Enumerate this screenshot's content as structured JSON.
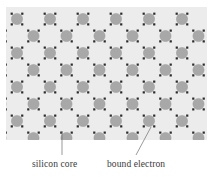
{
  "figure": {
    "type": "silicon-crystal-lattice-diagram",
    "top_caption_fragment": "",
    "panel": {
      "background_color": "#ececec",
      "x": 6,
      "y": 7,
      "width": 201,
      "height": 133
    },
    "atom": {
      "name": "silicon-core",
      "fill_color": "#a8a8a8",
      "stroke_color": "#9a9a9a",
      "radius": 5.6
    },
    "electron": {
      "name": "bound-electron",
      "fill_color": "#2b2b2b",
      "size": 2.2,
      "pairs_per_bond": 2
    },
    "lattice": {
      "col_spacing": 33,
      "row_spacing": 17,
      "stagger_offset": 16.5,
      "rows": 8,
      "cols_even_row": 7,
      "cols_odd_row": 7,
      "row_y": [
        12,
        29,
        46,
        63,
        80,
        97,
        114,
        131
      ],
      "x_start_even": 11,
      "x_start_odd": 27.5
    },
    "bonds": {
      "stroke_color": "#2b2b2b",
      "style": "diagonal-dotted-pairs"
    }
  },
  "labels": {
    "silicon_core": "silicon core",
    "bound_electron": "bound electron"
  },
  "leaders": [
    {
      "name": "leader-silicon-core",
      "from_x": 62,
      "from_y": 155,
      "to_x": 62,
      "to_y": 131,
      "color": "#6f6f6f"
    },
    {
      "name": "leader-bound-electron",
      "from_x": 136,
      "from_y": 155,
      "to_x": 151,
      "to_y": 127,
      "color": "#6f6f6f"
    }
  ]
}
